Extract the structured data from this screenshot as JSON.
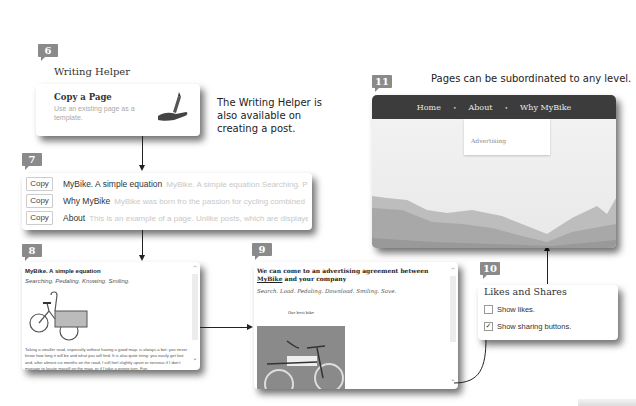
{
  "badges": {
    "b6": "6",
    "b7": "7",
    "b8": "8",
    "b9": "9",
    "b10": "10",
    "b11": "11"
  },
  "callouts": {
    "writing_helper_note": "The Writing Helper is also available on creating a post.",
    "pages_note": "Pages can be subordinated to any level."
  },
  "writing_helper": {
    "title": "Writing Helper",
    "option_title": "Copy a Page",
    "option_desc": "Use an existing page as a template.",
    "icon": "hand-pencil-icon"
  },
  "copy_list": {
    "rows": [
      {
        "button": "Copy",
        "title": "MyBike. A simple equation",
        "excerpt": "MyBike. A simple equation Searching. Pedaling. Knowing."
      },
      {
        "button": "Copy",
        "title": "Why MyBike",
        "excerpt": "MyBike was born fro the passion for cycling combined"
      },
      {
        "button": "Copy",
        "title": "About",
        "excerpt": "This is an example of a page. Unlike posts, which are displayed"
      }
    ]
  },
  "preview_page": {
    "title": "MyBike. A simple equation",
    "subtitle": "Searching. Pedaling. Knowing. Smiling.",
    "body": "Taking a smaller road, especially without having a good map, is always a bet: you never know how long it will be and what you will find. It is also quite tiring: you easily get lost and, after almost six months on the road, I still feel slightly upset or nervous if I don't manage to locate myself on the map, or if I take a wrong turn. Fun."
  },
  "preview_advertising": {
    "title_before": "We can come to an advertising agreement between ",
    "title_link": "MyBike",
    "title_after": " and your company",
    "subtitle": "Search. Load. Pedaling. Download. Smiling. Save.",
    "caption": "Our best bike"
  },
  "likes_shares": {
    "title": "Likes and Shares",
    "options": [
      {
        "label": "Show likes.",
        "checked": false
      },
      {
        "label": "Show sharing buttons.",
        "checked": true
      }
    ]
  },
  "site_nav": {
    "items": [
      "Home",
      "About",
      "Why MyBike"
    ],
    "separator": "•",
    "submenu": [
      "Advertising"
    ]
  },
  "colors": {
    "badge": "#8a8a8a",
    "nav_bg": "#3c3c3c"
  }
}
